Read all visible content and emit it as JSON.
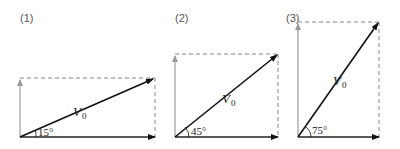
{
  "figures": [
    {
      "label": "(1)",
      "angle_label": "15°",
      "vector_label": "V",
      "vector_subscript": "0",
      "angle_deg": 15
    },
    {
      "label": "(2)",
      "angle_label": "45°",
      "vector_label": "V",
      "vector_subscript": "0",
      "angle_deg": 45
    },
    {
      "label": "(3)",
      "angle_label": "75°",
      "vector_label": "V",
      "vector_subscript": "0",
      "angle_deg": 75
    }
  ],
  "colors": {
    "vector": "#111111",
    "component_vertical": "#999999",
    "dashed": "#888888",
    "horizontal": "#222222"
  }
}
